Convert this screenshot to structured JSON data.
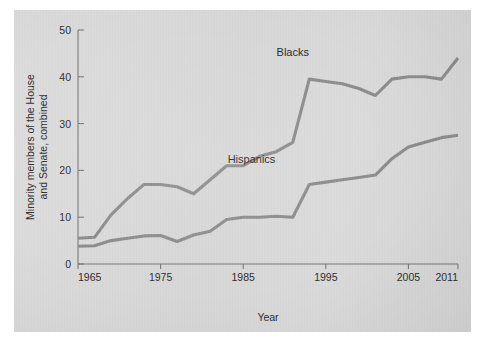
{
  "chart_data": {
    "type": "line",
    "title": "",
    "xlabel": "Year",
    "ylabel": "Minority members of the House and Senate, combined",
    "ylabel_line1": "Minority members of the House",
    "ylabel_line2": "and Senate, combined",
    "xlim": [
      1965,
      2011
    ],
    "ylim": [
      0,
      50
    ],
    "xticks": [
      1965,
      1975,
      1985,
      1995,
      2005,
      2011
    ],
    "xtick_labels": [
      "1965",
      "1975",
      "1985",
      "1995",
      "2005",
      "2011"
    ],
    "yticks": [
      0,
      10,
      20,
      30,
      40,
      50
    ],
    "ytick_labels": [
      "0",
      "10",
      "20",
      "30",
      "40",
      "50"
    ],
    "grid": false,
    "legend": "inline-labels",
    "line_color": "#8a8a8a",
    "background_color": "#d9d9d9",
    "axis_color": "#77777a",
    "text_color": "#2a2a2a",
    "series": [
      {
        "name": "Blacks",
        "label": "Blacks",
        "label_x": 1991,
        "label_y": 44.5,
        "x": [
          1965,
          1967,
          1969,
          1971,
          1973,
          1975,
          1977,
          1979,
          1981,
          1983,
          1985,
          1987,
          1989,
          1991,
          1993,
          1995,
          1997,
          1999,
          2001,
          2003,
          2005,
          2007,
          2009,
          2011
        ],
        "values": [
          5.5,
          5.7,
          10.5,
          14.0,
          17.0,
          17.0,
          16.5,
          15.0,
          18.0,
          21.0,
          21.0,
          23.0,
          24.0,
          26.0,
          39.5,
          39.0,
          38.5,
          37.5,
          36.0,
          39.5,
          40.0,
          40.0,
          39.5,
          44.0
        ]
      },
      {
        "name": "Hispanics",
        "label": "Hispanics",
        "label_x": 1986,
        "label_y": 21.5,
        "x": [
          1965,
          1967,
          1969,
          1971,
          1973,
          1975,
          1977,
          1979,
          1981,
          1983,
          1985,
          1987,
          1989,
          1991,
          1993,
          1995,
          1997,
          1999,
          2001,
          2003,
          2005,
          2007,
          2009,
          2011
        ],
        "values": [
          3.8,
          3.9,
          5.0,
          5.5,
          6.0,
          6.1,
          4.8,
          6.2,
          7.0,
          9.5,
          10.0,
          10.0,
          10.2,
          10.0,
          17.0,
          17.5,
          18.0,
          18.5,
          19.0,
          22.5,
          25.0,
          26.0,
          27.0,
          27.5
        ]
      }
    ]
  },
  "axes": {
    "x_axis_title": "Year"
  }
}
